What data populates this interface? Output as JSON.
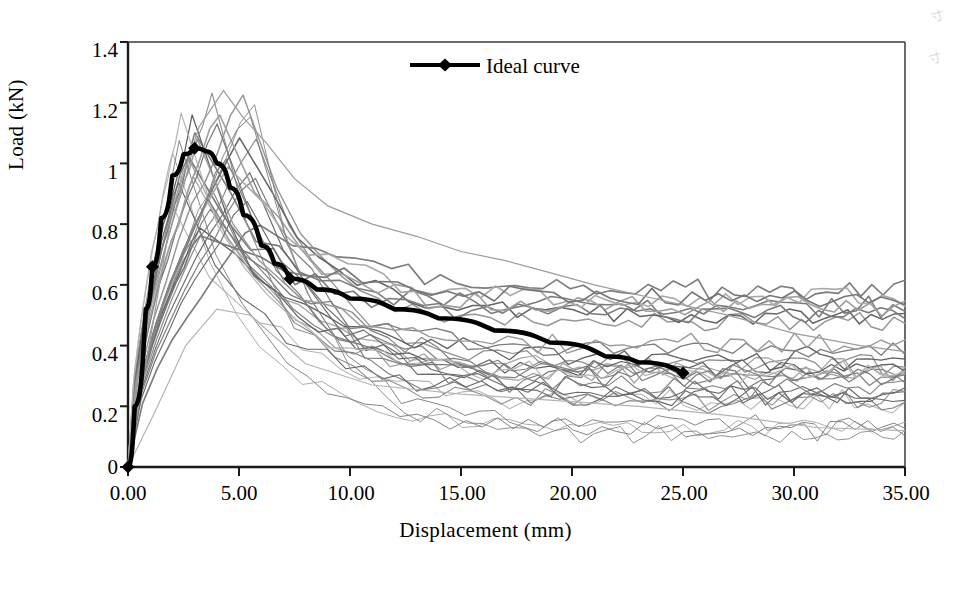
{
  "chart_data": {
    "type": "line",
    "title": "",
    "xlabel": "Displacement  (mm)",
    "ylabel": "Load (kN)",
    "xlim": [
      0,
      35
    ],
    "ylim": [
      0,
      1.4
    ],
    "xticks": [
      "0.00",
      "5.00",
      "10.00",
      "15.00",
      "20.00",
      "25.00",
      "30.00",
      "35.00"
    ],
    "xtick_values": [
      0,
      5,
      10,
      15,
      20,
      25,
      30,
      35
    ],
    "yticks": [
      "0",
      "0.2",
      "0.4",
      "0.6",
      "0.8",
      "1",
      "1.2",
      "1.4"
    ],
    "ytick_values": [
      0,
      0.2,
      0.4,
      0.6,
      0.8,
      1,
      1.2,
      1.4
    ],
    "grid": false,
    "legend_position": "top-center",
    "legend": [
      {
        "name": "Ideal curve",
        "color": "#000000",
        "marker": "diamond",
        "linewidth": 4
      }
    ],
    "series": [
      {
        "name": "Ideal curve",
        "color": "#000000",
        "marker": "diamond",
        "marker_points": [
          [
            0,
            0
          ],
          [
            1.1,
            0.66
          ],
          [
            3.0,
            1.05
          ],
          [
            7.3,
            0.62
          ],
          [
            25.0,
            0.31
          ]
        ],
        "x": [
          0,
          0.3,
          0.8,
          1.1,
          1.5,
          2.0,
          2.5,
          3.0,
          3.5,
          4.0,
          4.6,
          5.2,
          6.0,
          6.6,
          7.3,
          8.5,
          10.0,
          12.0,
          14.0,
          16.5,
          19.0,
          21.5,
          23.0,
          25.0
        ],
        "y": [
          0,
          0.2,
          0.52,
          0.66,
          0.82,
          0.96,
          1.03,
          1.05,
          1.04,
          1.0,
          0.92,
          0.83,
          0.73,
          0.67,
          0.62,
          0.585,
          0.555,
          0.52,
          0.49,
          0.45,
          0.41,
          0.365,
          0.345,
          0.31
        ]
      },
      {
        "name": "specimen-bundle",
        "description": "About 30 individual experimental load-displacement curves in shades of grey, all rising steeply from the origin to peaks between 0.78 and 1.24 kN at displacements of 2 to 6 mm, then decaying to a broad band of 0.1 to 0.6 kN at 35 mm.",
        "color": "#8a8a8a",
        "count": 30,
        "peak_load_range": [
          0.78,
          1.24
        ],
        "peak_displacement_range": [
          2.0,
          6.2
        ],
        "end_load_range": [
          0.1,
          0.6
        ]
      }
    ],
    "annotations": []
  },
  "axes": {
    "x_tick_labels": [
      "0.00",
      "5.00",
      "10.00",
      "15.00",
      "20.00",
      "25.00",
      "30.00",
      "35.00"
    ],
    "y_tick_labels": [
      "1.4",
      "1.2",
      "1",
      "0.8",
      "0.6",
      "0.4",
      "0.2",
      "0"
    ],
    "x_title": "Displacement  (mm)",
    "y_title": "Load (kN)"
  },
  "legend": {
    "entry_label": "Ideal curve"
  },
  "artifacts": {
    "scan_mark_top": "寸",
    "scan_mark_bottom": "寸"
  }
}
